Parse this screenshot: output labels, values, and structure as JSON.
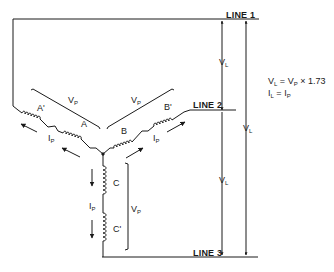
{
  "diagram": {
    "type": "wye-connected three-phase winding schematic",
    "lines": [
      {
        "id": "line1",
        "label": "LINE 1"
      },
      {
        "id": "line2",
        "label": "LINE 2"
      },
      {
        "id": "line3",
        "label": "LINE 3"
      }
    ],
    "windings": [
      {
        "id": "A",
        "label": "A"
      },
      {
        "id": "A_prime",
        "label": "A'"
      },
      {
        "id": "B",
        "label": "B"
      },
      {
        "id": "B_prime",
        "label": "B'"
      },
      {
        "id": "C",
        "label": "C"
      },
      {
        "id": "C_prime",
        "label": "C'"
      }
    ],
    "symbols": {
      "v": "V",
      "i": "I",
      "sub_l": "L",
      "sub_p": "P"
    },
    "formulas": {
      "line1": {
        "lhs_main": "V",
        "lhs_sub": "L",
        "eq": " = ",
        "rhs_main": "V",
        "rhs_sub": "P",
        "rest": " × 1.73"
      },
      "line2": {
        "lhs_main": "I",
        "lhs_sub": "L",
        "eq": " = ",
        "rhs_main": "I",
        "rhs_sub": "P"
      }
    },
    "line_color": "#1a1a1a"
  }
}
